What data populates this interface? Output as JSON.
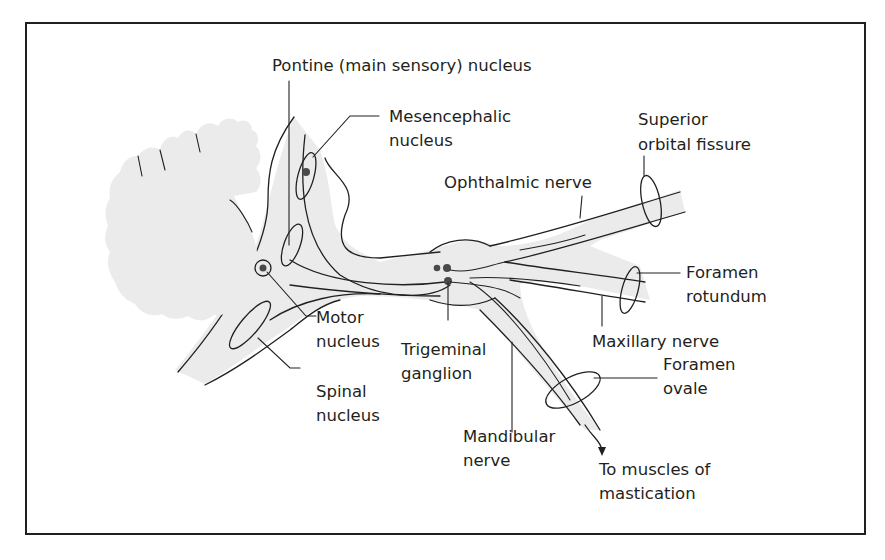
{
  "figure": {
    "frame": {
      "stroke": "#231f20",
      "fill": "#ffffff"
    },
    "colors": {
      "shade": "#ebebeb",
      "ink": "#231f20",
      "dot": "#4a4a4a"
    }
  },
  "labels": {
    "pontine_nucleus": "Pontine (main sensory) nucleus",
    "mesencephalic_line1": "Mesencephalic",
    "mesencephalic_line2": "nucleus",
    "superior_orbital_line1": "Superior",
    "superior_orbital_line2": "orbital fissure",
    "ophthalmic_nerve": "Ophthalmic nerve",
    "foramen_rotundum_line1": "Foramen",
    "foramen_rotundum_line2": "rotundum",
    "motor_line1": "Motor",
    "motor_line2": "nucleus",
    "trigeminal_line1": "Trigeminal",
    "trigeminal_line2": "ganglion",
    "maxillary_nerve": "Maxillary nerve",
    "foramen_ovale_line1": "Foramen",
    "foramen_ovale_line2": "ovale",
    "spinal_line1": "Spinal",
    "spinal_line2": "nucleus",
    "mandibular_line1": "Mandibular",
    "mandibular_line2": "nerve",
    "mastication_line1": "To muscles of",
    "mastication_line2": "mastication"
  }
}
